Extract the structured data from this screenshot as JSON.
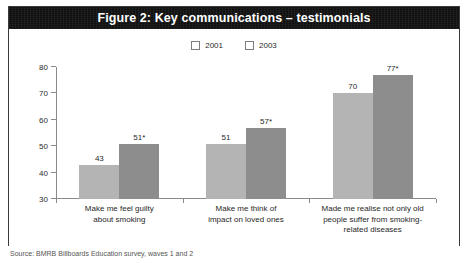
{
  "figure": {
    "title": "Figure 2: Key communications – testimonials",
    "source": "Source: BMRB Billboards Education survey, waves 1 and 2"
  },
  "colors": {
    "series_2001": "#b4b4b4",
    "series_2003": "#8d8d8d",
    "title_bar": "#101010",
    "title_text": "#ffffff",
    "axis": "#8a8a8a"
  },
  "chart_data": {
    "type": "bar",
    "title": "Figure 2: Key communications – testimonials",
    "xlabel": "",
    "ylabel": "",
    "ylim": [
      30,
      80
    ],
    "yticks": [
      30,
      40,
      50,
      60,
      70,
      80
    ],
    "grid": false,
    "legend_position": "top-center",
    "categories": [
      "Make me feel guilty about smoking",
      "Make me think of impact on loved ones",
      "Made me realise not only old people suffer from smoking-related diseases"
    ],
    "category_lines": [
      [
        "Make me feel guilty",
        "about smoking"
      ],
      [
        "Make me think of",
        "impact on loved ones"
      ],
      [
        "Made me realise not only old",
        "people suffer from smoking-",
        "related diseases"
      ]
    ],
    "series": [
      {
        "name": "2001",
        "values": [
          43,
          51,
          70
        ],
        "labels": [
          "43",
          "51",
          "70"
        ]
      },
      {
        "name": "2003",
        "values": [
          51,
          57,
          77
        ],
        "labels": [
          "51*",
          "57*",
          "77*"
        ]
      }
    ]
  }
}
